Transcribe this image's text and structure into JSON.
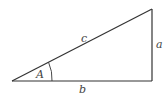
{
  "diagram": {
    "type": "right-triangle",
    "labels": {
      "hypotenuse": "c",
      "opposite": "a",
      "adjacent": "b",
      "angle": "A"
    },
    "colors": {
      "stroke": "#333333",
      "label": "#444444"
    }
  }
}
